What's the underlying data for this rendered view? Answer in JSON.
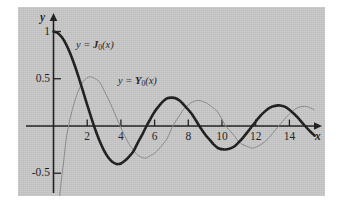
{
  "figure": {
    "background_color": "#c9c9c9",
    "page_color": "#ffffff",
    "axis_color": "#1a1a1a"
  },
  "axes": {
    "x_axis_name": "x",
    "y_axis_name": "y",
    "x_ticks": [
      "2",
      "4",
      "6",
      "8",
      "10",
      "12",
      "14"
    ],
    "x_tick_values": [
      2,
      4,
      6,
      8,
      10,
      12,
      14
    ],
    "y_ticks": [
      "1",
      "0.5",
      "-0.5"
    ],
    "y_tick_values": [
      1,
      0.5,
      -0.5
    ]
  },
  "annotations": [
    {
      "name": "j0-label",
      "prefix": "y = ",
      "symbol": "J",
      "subscript": "0",
      "suffix": "(x)",
      "text": "y = J0(x)"
    },
    {
      "name": "y0-label",
      "prefix": "y = ",
      "symbol": "Y",
      "subscript": "0",
      "suffix": "(x)",
      "text": "y = Y0(x)"
    }
  ],
  "chart_data": {
    "type": "line",
    "title": "",
    "subtitle": "",
    "xlabel": "x",
    "ylabel": "y",
    "xlim": [
      -0.35,
      15.6
    ],
    "ylim": [
      -0.75,
      1.15
    ],
    "grid": false,
    "legend": "inline-annotations",
    "xticks": [
      2,
      4,
      6,
      8,
      10,
      12,
      14
    ],
    "yticks": [
      1,
      0.5,
      -0.5
    ],
    "series": [
      {
        "name": "y = J0(x)",
        "color": "#1a1a1a",
        "width": 2.6,
        "zeros": [
          2.405,
          5.52,
          8.654,
          11.792,
          14.931
        ],
        "extrema": [
          {
            "x": 0.0,
            "y": 1.0
          },
          {
            "x": 3.83,
            "y": -0.403
          },
          {
            "x": 7.02,
            "y": 0.3
          },
          {
            "x": 10.17,
            "y": -0.25
          },
          {
            "x": 13.32,
            "y": 0.218
          }
        ],
        "x": [
          0,
          0.25,
          0.5,
          0.75,
          1,
          1.25,
          1.5,
          1.75,
          2,
          2.25,
          2.405,
          2.5,
          2.75,
          3,
          3.25,
          3.5,
          3.75,
          3.83,
          4,
          4.25,
          4.5,
          4.75,
          5,
          5.25,
          5.52,
          5.75,
          6,
          6.25,
          6.5,
          6.75,
          7.02,
          7.25,
          7.5,
          7.75,
          8,
          8.25,
          8.654,
          9,
          9.25,
          9.5,
          9.75,
          10.17,
          10.5,
          10.75,
          11,
          11.25,
          11.5,
          11.792,
          12,
          12.25,
          12.5,
          12.75,
          13,
          13.32,
          13.5,
          13.75,
          14,
          14.25,
          14.5,
          14.931,
          15.2,
          15.5
        ],
        "y": [
          1.0,
          0.9844,
          0.9385,
          0.8642,
          0.7652,
          0.6459,
          0.5118,
          0.369,
          0.2239,
          0.0827,
          0.0,
          -0.0484,
          -0.1641,
          -0.2601,
          -0.3326,
          -0.3801,
          -0.4026,
          -0.4027,
          -0.3971,
          -0.3658,
          -0.3205,
          -0.2655,
          -0.1776,
          -0.0968,
          0.0,
          0.0738,
          0.1506,
          0.2095,
          0.2601,
          0.2936,
          0.3001,
          0.2945,
          0.2663,
          0.2218,
          0.1717,
          0.1174,
          0.0,
          -0.0903,
          -0.1419,
          -0.1939,
          -0.2324,
          -0.249,
          -0.2366,
          -0.2136,
          -0.1712,
          -0.1222,
          -0.0677,
          0.0,
          0.0477,
          0.1031,
          0.1469,
          0.1836,
          0.2069,
          0.2184,
          0.215,
          0.2016,
          0.1711,
          0.1324,
          0.0882,
          0.0,
          -0.0512,
          -0.1025
        ]
      },
      {
        "name": "y = Y0(x)",
        "color": "#8a8a8a",
        "width": 1.0,
        "zeros": [
          0.894,
          3.958,
          7.086,
          10.222,
          13.361
        ],
        "extrema": [
          {
            "x": 2.2,
            "y": 0.521
          },
          {
            "x": 5.43,
            "y": -0.34
          },
          {
            "x": 8.6,
            "y": 0.271
          },
          {
            "x": 11.75,
            "y": -0.234
          },
          {
            "x": 14.9,
            "y": 0.209
          }
        ],
        "x": [
          0.18,
          0.3,
          0.45,
          0.6,
          0.75,
          0.894,
          1,
          1.25,
          1.5,
          1.75,
          2,
          2.2,
          2.5,
          2.75,
          3,
          3.25,
          3.5,
          3.75,
          3.958,
          4.25,
          4.5,
          4.75,
          5,
          5.43,
          5.75,
          6,
          6.25,
          6.5,
          6.75,
          7.086,
          7.5,
          7.75,
          8,
          8.25,
          8.6,
          9,
          9.25,
          9.5,
          9.75,
          10.222,
          10.5,
          10.75,
          11,
          11.25,
          11.75,
          12,
          12.25,
          12.5,
          12.75,
          13,
          13.361,
          13.75,
          14,
          14.25,
          14.5,
          14.9,
          15.2,
          15.5
        ],
        "y": [
          -1.25,
          -0.9,
          -0.6,
          -0.38,
          -0.14,
          0.0,
          0.0883,
          0.2582,
          0.3824,
          0.4682,
          0.5104,
          0.5207,
          0.4981,
          0.4605,
          0.3769,
          0.2882,
          0.189,
          0.0842,
          0.0,
          -0.1126,
          -0.1947,
          -0.2554,
          -0.3085,
          -0.3402,
          -0.3127,
          -0.2882,
          -0.2437,
          -0.1907,
          -0.1312,
          0.0,
          0.1173,
          0.1853,
          0.2235,
          0.2533,
          0.2702,
          0.2499,
          0.2231,
          0.1878,
          0.1469,
          0.0,
          -0.054,
          -0.1086,
          -0.1688,
          -0.1977,
          -0.2325,
          -0.2252,
          -0.203,
          -0.1712,
          -0.1321,
          -0.0782,
          0.0,
          0.0818,
          0.1272,
          0.1665,
          0.195,
          0.2086,
          0.1955,
          0.17
        ]
      }
    ]
  }
}
